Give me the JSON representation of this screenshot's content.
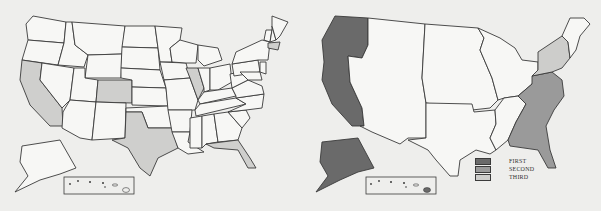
{
  "colors": {
    "background": "#eeeeec",
    "unshaded": "#f7f7f5",
    "highlight": "#cfcfcd",
    "first": "#6a6a6a",
    "second": "#9a9a9a",
    "third": "#cdcdcb",
    "border": "#3a3a3a"
  },
  "left_map": {
    "title": "",
    "highlighted_states": [
      "California",
      "Colorado",
      "Texas",
      "Illinois",
      "Florida",
      "Massachusetts"
    ]
  },
  "right_map": {
    "regions": [
      {
        "name": "West Coast + Alaska",
        "rank": "FIRST"
      },
      {
        "name": "Mountain West",
        "rank": "none"
      },
      {
        "name": "Great Plains / Central",
        "rank": "none"
      },
      {
        "name": "South Central",
        "rank": "none"
      },
      {
        "name": "Midwest / Great Lakes",
        "rank": "none"
      },
      {
        "name": "Southeast / Mid-Atlantic",
        "rank": "SECOND"
      },
      {
        "name": "Northeast (NY/PA/NJ)",
        "rank": "THIRD"
      },
      {
        "name": "New England",
        "rank": "none"
      }
    ]
  },
  "legend": {
    "items": [
      {
        "label": "FIRST",
        "color": "#6a6a6a"
      },
      {
        "label": "SECOND",
        "color": "#9a9a9a"
      },
      {
        "label": "THIRD",
        "color": "#cdcdcb"
      }
    ]
  }
}
